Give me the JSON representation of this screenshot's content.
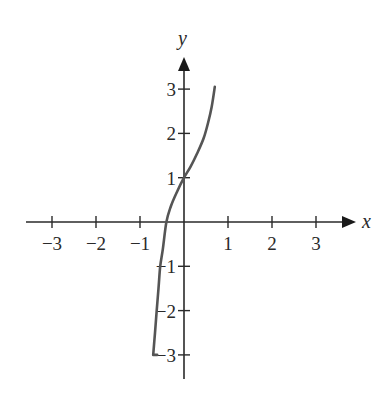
{
  "chart_data": {
    "type": "line",
    "title": "",
    "xlabel": "x",
    "ylabel": "y",
    "xlim": [
      -3.5,
      3.5
    ],
    "ylim": [
      -3.5,
      3.5
    ],
    "grid": false,
    "x_ticks": [
      -3,
      -2,
      -1,
      1,
      2,
      3
    ],
    "y_ticks": [
      -3,
      -2,
      -1,
      1,
      2,
      3
    ],
    "x_tick_labels": [
      "−3",
      "−2",
      "−1",
      "1",
      "2",
      "3"
    ],
    "y_tick_labels": [
      "−3",
      "−2",
      "−1",
      "1",
      "2",
      "3"
    ],
    "series": [
      {
        "name": "curve",
        "color": "#555555",
        "points": [
          [
            -0.7,
            -3.0
          ],
          [
            -0.66,
            -2.5
          ],
          [
            -0.62,
            -2.0
          ],
          [
            -0.58,
            -1.5
          ],
          [
            -0.54,
            -1.0
          ],
          [
            -0.48,
            -0.6
          ],
          [
            -0.4,
            0.0
          ],
          [
            -0.3,
            0.35
          ],
          [
            -0.15,
            0.7
          ],
          [
            0.0,
            1.0
          ],
          [
            0.15,
            1.25
          ],
          [
            0.3,
            1.55
          ],
          [
            0.45,
            1.9
          ],
          [
            0.55,
            2.25
          ],
          [
            0.63,
            2.6
          ],
          [
            0.7,
            3.05
          ]
        ]
      }
    ]
  }
}
